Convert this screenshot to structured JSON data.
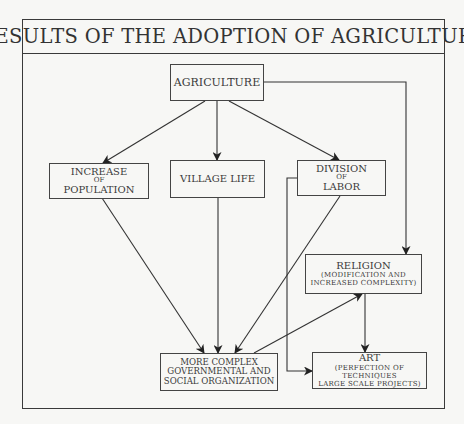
{
  "title": "RESULTS OF THE ADOPTION OF AGRICULTURE",
  "nodes": {
    "agriculture": {
      "label": "AGRICULTURE"
    },
    "population": {
      "lines": [
        "INCREASE",
        "OF",
        "POPULATION"
      ]
    },
    "village": {
      "label": "VILLAGE LIFE"
    },
    "labor": {
      "lines": [
        "DIVISION",
        "OF",
        "LABOR"
      ]
    },
    "religion": {
      "label": "RELIGION",
      "sub": [
        "(MODIFICATION AND",
        "INCREASED COMPLEXITY)"
      ]
    },
    "government": {
      "lines": [
        "MORE COMPLEX",
        "GOVERNMENTAL AND",
        "SOCIAL ORGANIZATION"
      ]
    },
    "art": {
      "label": "ART",
      "sub": [
        "(PERFECTION OF TECHNIQUES",
        "LARGE SCALE PROJECTS)"
      ]
    }
  },
  "edges": [
    {
      "from": "agriculture",
      "to": "population"
    },
    {
      "from": "agriculture",
      "to": "village"
    },
    {
      "from": "agriculture",
      "to": "labor"
    },
    {
      "from": "agriculture",
      "to": "religion"
    },
    {
      "from": "population",
      "to": "government"
    },
    {
      "from": "village",
      "to": "government"
    },
    {
      "from": "labor",
      "to": "government"
    },
    {
      "from": "labor",
      "to": "art"
    },
    {
      "from": "government",
      "to": "religion"
    },
    {
      "from": "religion",
      "to": "art"
    }
  ]
}
